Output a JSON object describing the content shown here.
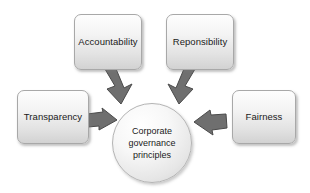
{
  "diagram": {
    "center": {
      "name": "corporate-governance-principles",
      "lines": [
        "Corporate",
        "governance",
        "principles"
      ]
    },
    "nodes": [
      {
        "id": "accountability",
        "label": "Accountability",
        "position": "top-left"
      },
      {
        "id": "responsibility",
        "label": "Reponsibility",
        "position": "top-right"
      },
      {
        "id": "transparency",
        "label": "Transparency",
        "position": "left"
      },
      {
        "id": "fairness",
        "label": "Fairness",
        "position": "right"
      }
    ],
    "arrows": [
      {
        "id": "accountability-to-center",
        "from": "Accountability",
        "to": "Corporate governance principles",
        "direction": "down-right"
      },
      {
        "id": "responsibility-to-center",
        "from": "Reponsibility",
        "to": "Corporate governance principles",
        "direction": "down-left"
      },
      {
        "id": "transparency-to-center",
        "from": "Transparency",
        "to": "Corporate governance principles",
        "direction": "right"
      },
      {
        "id": "fairness-to-center",
        "from": "Fairness",
        "to": "Corporate governance principles",
        "direction": "left"
      }
    ],
    "colors": {
      "background": "#ffffff",
      "box_border": "#a8a8a8",
      "box_fill_top": "#fdfdfd",
      "box_fill_bottom": "#d2d2d2",
      "arrow_fill": "#6f6f6f",
      "arrow_border": "#4a4a4a",
      "text": "#1a1a1a"
    }
  }
}
